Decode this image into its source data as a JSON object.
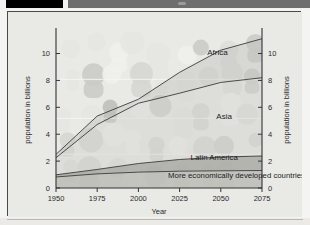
{
  "window": {
    "topbar_left_block": "",
    "topbar_right_block": ""
  },
  "chart_data": {
    "type": "area",
    "title": "",
    "subtitle": "",
    "xlabel": "Year",
    "ylabel": "population in billions",
    "ylabel_right": "population in billions",
    "x": [
      1950,
      1975,
      2000,
      2025,
      2050,
      2075
    ],
    "xtick_labels": [
      "1950",
      "1975",
      "2000",
      "2025",
      "2050",
      "2075"
    ],
    "ytick_labels": [
      "0",
      "2",
      "4",
      "6",
      "8",
      "10"
    ],
    "ytick_values": [
      0,
      2,
      4,
      6,
      8,
      10
    ],
    "ytick_labels_right": [
      "0",
      "2",
      "4",
      "6",
      "8",
      "10"
    ],
    "xlim": [
      1950,
      2075
    ],
    "ylim": [
      0,
      11.6
    ],
    "grid": false,
    "legend_position": "inline-annotations",
    "stacked": true,
    "series": [
      {
        "name": "More economically developed countries",
        "label": "More economically developed countries",
        "cumulative_top": [
          0.82,
          1.05,
          1.18,
          1.25,
          1.28,
          1.3
        ],
        "values": [
          0.82,
          1.05,
          1.18,
          1.25,
          1.28,
          1.3
        ],
        "color": "#b9b9b4"
      },
      {
        "name": "Latin America",
        "label": "Latin America",
        "cumulative_top": [
          0.98,
          1.38,
          1.82,
          2.12,
          2.3,
          2.38
        ],
        "values": [
          0.16,
          0.33,
          0.64,
          0.87,
          1.02,
          1.08
        ],
        "color": "#a6a6a1"
      },
      {
        "name": "Asia",
        "label": "Asia",
        "cumulative_top": [
          2.25,
          4.72,
          6.3,
          7.05,
          7.85,
          8.2
        ],
        "values": [
          1.27,
          3.34,
          4.48,
          4.93,
          5.55,
          5.82
        ],
        "color": "#cfcfca"
      },
      {
        "name": "Africa",
        "label": "Africa",
        "cumulative_top": [
          2.5,
          5.35,
          6.6,
          8.6,
          10.25,
          11.1
        ],
        "values": [
          0.25,
          0.63,
          0.3,
          1.55,
          2.4,
          2.9
        ],
        "color": "#c2c2bc"
      }
    ],
    "annotations": [
      {
        "text": "Africa",
        "x": 2048,
        "y": 9.9
      },
      {
        "text": "Asia",
        "x": 2052,
        "y": 5.1
      },
      {
        "text": "Latin America",
        "x": 2046,
        "y": 2.05
      },
      {
        "text": "More economically developed countries",
        "x": 2018,
        "y": 0.72
      }
    ]
  }
}
